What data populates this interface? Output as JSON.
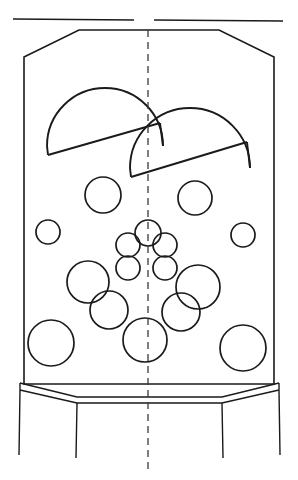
{
  "drawing": {
    "title": "Vessel Cross-Section Technical Drawing",
    "canvas": {
      "width": 298,
      "height": 480
    },
    "colors": {
      "line": "#1a1a1a",
      "centerline": "#3a3a3a",
      "background": "#ffffff"
    },
    "centerline": {
      "label": "vertical-centerline",
      "x": 148,
      "y_start": 30,
      "y_end": 470,
      "dash": "7 5"
    },
    "top_rule": {
      "label": "top-reference-line",
      "left_segment": {
        "x1": 13,
        "y1": 19,
        "x2": 134,
        "y2": 20
      },
      "right_segment": {
        "x1": 154,
        "y1": 20,
        "x2": 283,
        "y2": 21
      }
    },
    "vessel_outline": {
      "label": "vessel-body-outline",
      "points": "79,30 219,30 274,57 274,384 24,384 24,57 79,30",
      "top_left_chamfer": {
        "x1": 24,
        "y1": 57,
        "x2": 79,
        "y2": 30
      },
      "top_right_chamfer": {
        "x1": 219,
        "y1": 30,
        "x2": 274,
        "y2": 57
      },
      "left_wall_x": 24,
      "right_wall_x": 274,
      "top_y": 30,
      "bottom_y": 384
    },
    "bottom_skirt": {
      "label": "bottom-chamfered-band",
      "upper_path": "20,383 77,397 222,397 279,383",
      "lower_path": "20,390 77,403 222,403 279,390",
      "left_edge": {
        "x1": 20,
        "y1": 383,
        "x2": 20,
        "y2": 390
      },
      "right_edge": {
        "x1": 279,
        "y1": 383,
        "x2": 279,
        "y2": 390
      }
    },
    "legs": [
      {
        "label": "leg-outer-left",
        "x1": 20,
        "y1": 390,
        "x2": 19,
        "y2": 455
      },
      {
        "label": "leg-inner-left",
        "x1": 77,
        "y1": 403,
        "x2": 76,
        "y2": 458
      },
      {
        "label": "leg-inner-right",
        "x1": 222,
        "y1": 403,
        "x2": 223,
        "y2": 458
      },
      {
        "label": "leg-outer-right",
        "x1": 279,
        "y1": 390,
        "x2": 280,
        "y2": 455
      }
    ],
    "domes": [
      {
        "label": "dome-left",
        "arc": "M 47,146 A 58 58 0 0 1 163,146",
        "base": "M 47,146 L 163,146",
        "base_slant": "M 48,155 L 160,123",
        "close_left": "M 47,146 L 48,155",
        "close_right": "M 163,146 L 160,123",
        "center_x": 105,
        "radius": 58
      },
      {
        "label": "dome-right",
        "arc": "M 130,168 A 60 60 0 0 1 250,168",
        "base": "M 130,168 L 250,168",
        "base_slant": "M 131,177 L 247,142",
        "close_left": "M 130,168 L 131,177",
        "close_right": "M 250,168 L 247,142",
        "center_x": 190,
        "radius": 60
      }
    ],
    "circles": [
      {
        "label": "circle-upper-left-mid",
        "cx": 103,
        "cy": 195,
        "r": 18
      },
      {
        "label": "circle-upper-right-mid",
        "cx": 195,
        "cy": 198,
        "r": 17
      },
      {
        "label": "circle-left-small",
        "cx": 48,
        "cy": 232,
        "r": 12
      },
      {
        "label": "circle-right-small",
        "cx": 243,
        "cy": 235,
        "r": 12
      },
      {
        "label": "circle-cluster-top",
        "cx": 148,
        "cy": 233,
        "r": 13
      },
      {
        "label": "circle-cluster-upleft",
        "cx": 128,
        "cy": 245,
        "r": 12
      },
      {
        "label": "circle-cluster-upright",
        "cx": 165,
        "cy": 245,
        "r": 12
      },
      {
        "label": "circle-cluster-lowleft",
        "cx": 128,
        "cy": 268,
        "r": 12
      },
      {
        "label": "circle-cluster-lowright",
        "cx": 165,
        "cy": 268,
        "r": 12
      },
      {
        "label": "circle-mid-left-large",
        "cx": 88,
        "cy": 282,
        "r": 21
      },
      {
        "label": "circle-mid-right-large",
        "cx": 198,
        "cy": 287,
        "r": 22
      },
      {
        "label": "circle-lower-left-mid",
        "cx": 109,
        "cy": 310,
        "r": 19
      },
      {
        "label": "circle-lower-right-mid",
        "cx": 181,
        "cy": 312,
        "r": 19
      },
      {
        "label": "circle-bottom-center",
        "cx": 145,
        "cy": 340,
        "r": 22
      },
      {
        "label": "circle-bottom-left",
        "cx": 51,
        "cy": 343,
        "r": 23
      },
      {
        "label": "circle-bottom-right",
        "cx": 243,
        "cy": 348,
        "r": 23
      }
    ]
  }
}
